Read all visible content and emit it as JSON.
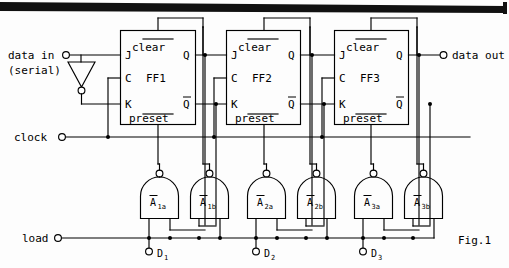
{
  "figure": {
    "caption": "Fig.1"
  },
  "terminals": {
    "data_in_line1": "data in",
    "data_in_line2": "(serial)",
    "data_out": "data out",
    "clock": "clock",
    "load": "load"
  },
  "flipflops": [
    {
      "name": "FF1",
      "clear": "clear",
      "preset": "preset",
      "j": "J",
      "c": "C",
      "k": "K",
      "q": "Q",
      "qbar": "Q"
    },
    {
      "name": "FF2",
      "clear": "clear",
      "preset": "preset",
      "j": "J",
      "c": "C",
      "k": "K",
      "q": "Q",
      "qbar": "Q"
    },
    {
      "name": "FF3",
      "clear": "clear",
      "preset": "preset",
      "j": "J",
      "c": "C",
      "k": "K",
      "q": "Q",
      "qbar": "Q"
    }
  ],
  "gates": [
    {
      "base": "A",
      "sub": "1a"
    },
    {
      "base": "A",
      "sub": "1b"
    },
    {
      "base": "A",
      "sub": "2a"
    },
    {
      "base": "A",
      "sub": "2b"
    },
    {
      "base": "A",
      "sub": "3a"
    },
    {
      "base": "A",
      "sub": "3b"
    }
  ],
  "data_inputs": [
    {
      "base": "D",
      "sub": "1"
    },
    {
      "base": "D",
      "sub": "2"
    },
    {
      "base": "D",
      "sub": "3"
    }
  ],
  "colors": {
    "ink": "#000000",
    "paper": "#fdfdfd",
    "scan_bar": "#111111"
  }
}
